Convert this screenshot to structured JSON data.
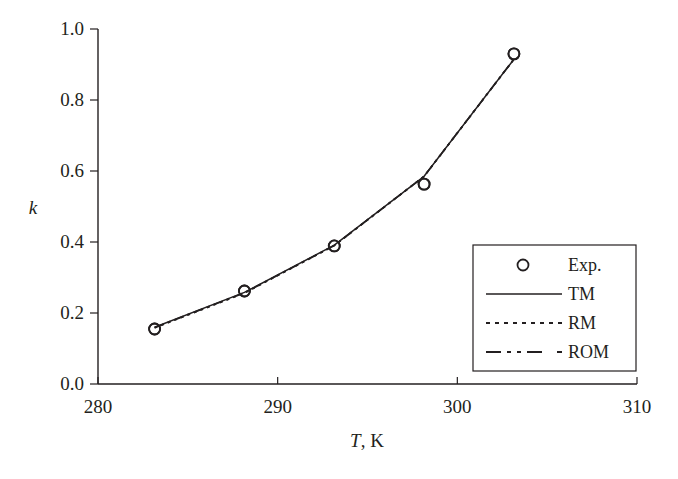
{
  "chart_data": {
    "type": "line",
    "title": "",
    "xlabel": "T, K",
    "xlabel_italic_part": "T",
    "xlabel_rest": ", K",
    "ylabel": "k",
    "xlim": [
      280,
      310
    ],
    "ylim": [
      0.0,
      1.0
    ],
    "xticks": [
      280,
      290,
      300,
      310
    ],
    "xtick_labels": [
      "280",
      "290",
      "300",
      "310"
    ],
    "yticks": [
      0.0,
      0.2,
      0.4,
      0.6,
      0.8,
      1.0
    ],
    "ytick_labels": [
      "0.0",
      "0.2",
      "0.4",
      "0.6",
      "0.8",
      "1.0"
    ],
    "grid": false,
    "legend_position": "lower right",
    "series": [
      {
        "name": "Exp.",
        "style": "markers",
        "marker": "open-circle",
        "x": [
          283.15,
          288.15,
          293.15,
          298.15,
          303.15
        ],
        "values": [
          0.155,
          0.262,
          0.389,
          0.563,
          0.93
        ]
      },
      {
        "name": "TM",
        "style": "solid",
        "x": [
          283.15,
          288.15,
          293.15,
          298.15,
          303.15
        ],
        "values": [
          0.16,
          0.258,
          0.391,
          0.585,
          0.915
        ]
      },
      {
        "name": "RM",
        "style": "dotted",
        "x": [
          283.15,
          288.15,
          293.15,
          298.15,
          303.15
        ],
        "values": [
          0.158,
          0.256,
          0.39,
          0.585,
          0.915
        ]
      },
      {
        "name": "ROM",
        "style": "dash-dot",
        "x": [
          283.15,
          288.15,
          293.15,
          298.15,
          303.15
        ],
        "values": [
          0.159,
          0.257,
          0.39,
          0.585,
          0.915
        ]
      }
    ]
  },
  "legend": {
    "items": [
      {
        "label": "Exp.",
        "symbol": "open-circle"
      },
      {
        "label": "TM",
        "symbol": "solid-line"
      },
      {
        "label": "RM",
        "symbol": "dotted-line"
      },
      {
        "label": "ROM",
        "symbol": "dash-dot-line"
      }
    ]
  },
  "colors": {
    "ink": "#231f20",
    "background": "#ffffff"
  }
}
